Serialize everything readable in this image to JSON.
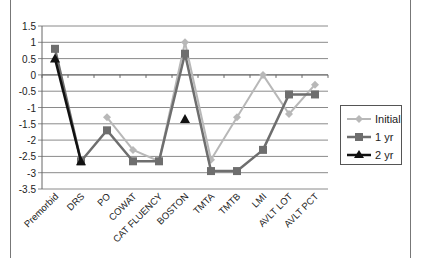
{
  "chart_data": {
    "type": "line",
    "title": "",
    "xlabel": "",
    "ylabel": "",
    "ylim": [
      -3.5,
      1.5
    ],
    "yticks": [
      1.5,
      1,
      0.5,
      0,
      -0.5,
      -1,
      -1.5,
      -2,
      -2.5,
      -3,
      -3.5
    ],
    "ytick_labels": [
      "1.5",
      "1",
      "0.5",
      "0",
      "-0.5",
      "-1",
      "-1.5",
      "-2",
      "-2.5",
      "-3",
      "-3.5"
    ],
    "grid": true,
    "legend_position": "right",
    "categories": [
      "Premorbid",
      "DRS",
      "PO",
      "COWAT",
      "CAT FLUENCY",
      "BOSTON",
      "TMTA",
      "TMTB",
      "LMI",
      "AVLT LOT",
      "AVLT PCT"
    ],
    "series": [
      {
        "name": "Initial",
        "color": "#b8b8b8",
        "marker": "diamond",
        "values": [
          null,
          null,
          -1.3,
          -2.3,
          -2.65,
          1.0,
          -2.6,
          -1.3,
          0.0,
          -1.2,
          -0.3
        ]
      },
      {
        "name": "1 yr",
        "color": "#6e6e6e",
        "marker": "square",
        "values": [
          0.8,
          -2.65,
          -1.7,
          -2.65,
          -2.65,
          0.65,
          -2.95,
          -2.95,
          -2.3,
          -0.6,
          -0.6
        ]
      },
      {
        "name": "2 yr",
        "color": "#111111",
        "marker": "triangle",
        "values": [
          0.5,
          -2.65,
          null,
          null,
          null,
          -1.35,
          null,
          null,
          null,
          null,
          null
        ]
      }
    ]
  },
  "legend": {
    "items": [
      {
        "label": "Initial"
      },
      {
        "label": "1 yr"
      },
      {
        "label": "2 yr"
      }
    ]
  }
}
